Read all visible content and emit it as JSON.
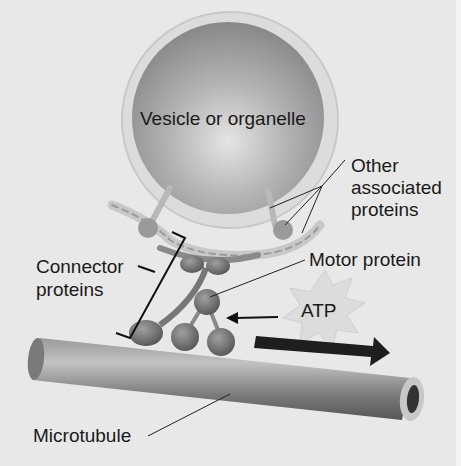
{
  "labels": {
    "vesicle": "Vesicle or organelle",
    "other_1": "Other",
    "other_2": "associated",
    "other_3": "proteins",
    "connector_1": "Connector",
    "connector_2": "proteins",
    "motor": "Motor protein",
    "atp": "ATP",
    "microtubule": "Microtubule"
  },
  "colors": {
    "background": "#e8e8e8",
    "vesicle": "#a8a8a8",
    "motor": "#7a7a7a",
    "microtubule": "#8a8a8a",
    "arrow": "#1a1a1a",
    "atp_burst": "#d8d8d8"
  }
}
